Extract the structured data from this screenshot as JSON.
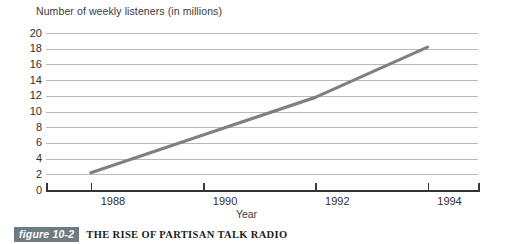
{
  "figure": {
    "badge_label": "figure 10-2",
    "caption_title": "THE RISE OF PARTISAN TALK RADIO"
  },
  "colors": {
    "line": "#808080",
    "gridline": "#b9b9b9",
    "axis": "#333333",
    "badge_background": "#6d7b82",
    "badge_text": "#ffffff",
    "background": "#ffffff"
  },
  "chart_data": {
    "type": "line",
    "title": "THE RISE OF PARTISAN TALK RADIO",
    "subtitle": "",
    "xlabel": "Year",
    "ylabel": "Number of weekly listeners (in millions)",
    "x": [
      1988,
      1990,
      1992,
      1994
    ],
    "values": [
      2.2,
      7.0,
      11.8,
      18.2
    ],
    "series": [
      {
        "name": "Weekly listeners",
        "values": [
          2.2,
          7.0,
          11.8,
          18.2
        ]
      }
    ],
    "xlim": [
      1987.2,
      1994.9
    ],
    "ylim": [
      0,
      20
    ],
    "xticks": [
      1988,
      1990,
      1992,
      1994
    ],
    "xtick_labels": [
      "1988",
      "1990",
      "1992",
      "1994"
    ],
    "yticks": [
      0,
      2,
      4,
      6,
      8,
      10,
      12,
      14,
      16,
      18,
      20
    ],
    "ytick_labels": [
      "20",
      "18",
      "16",
      "14",
      "12",
      "10",
      "8",
      "6",
      "4",
      "2",
      "0"
    ],
    "grid": "horizontal",
    "legend": "none"
  }
}
